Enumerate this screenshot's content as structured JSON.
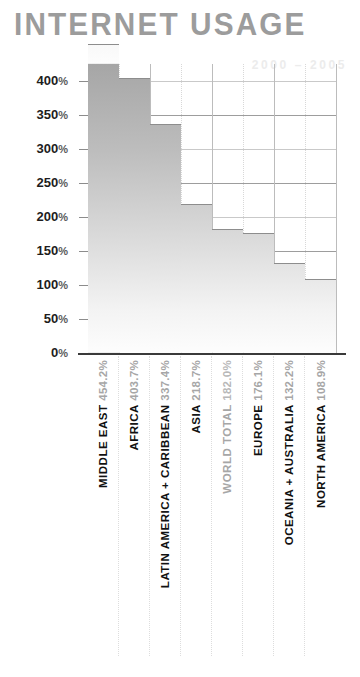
{
  "chart_data": {
    "type": "bar",
    "title": "INTERNET USAGE",
    "subtitle": "2000 – 2005",
    "xlabel": "",
    "ylabel": "",
    "ylim": [
      0,
      425
    ],
    "grid": true,
    "legend": "none",
    "orientation": "vertical",
    "yticks": [
      "0%",
      "50%",
      "100%",
      "150%",
      "200%",
      "250%",
      "300%",
      "350%",
      "400%"
    ],
    "ytick_values": [
      0,
      50,
      100,
      150,
      200,
      250,
      300,
      350,
      400
    ],
    "categories": [
      "MIDDLE EAST",
      "AFRICA",
      "LATIN AMERICA + CARIBBEAN",
      "ASIA",
      "WORLD TOTAL",
      "EUROPE",
      "OCEANIA + AUSTRALIA",
      "NORTH AMERICA"
    ],
    "values": [
      454.2,
      403.7,
      337.4,
      218.7,
      182.0,
      176.1,
      132.2,
      108.9
    ],
    "value_labels": [
      "454.2%",
      "403.7%",
      "337.4%",
      "218.7%",
      "182.0%",
      "176.1%",
      "132.2%",
      "108.9%"
    ],
    "bars": [
      {
        "name": "MIDDLE EAST",
        "value": 454.2,
        "value_label": "454.2%",
        "muted": false
      },
      {
        "name": "AFRICA",
        "value": 403.7,
        "value_label": "403.7%",
        "muted": false
      },
      {
        "name": "LATIN AMERICA + CARIBBEAN",
        "value": 337.4,
        "value_label": "337.4%",
        "muted": false
      },
      {
        "name": "ASIA",
        "value": 218.7,
        "value_label": "218.7%",
        "muted": false
      },
      {
        "name": "WORLD TOTAL",
        "value": 182.0,
        "value_label": "182.0%",
        "muted": true
      },
      {
        "name": "EUROPE",
        "value": 176.1,
        "value_label": "176.1%",
        "muted": false
      },
      {
        "name": "OCEANIA + AUSTRALIA",
        "value": 132.2,
        "value_label": "132.2%",
        "muted": false
      },
      {
        "name": "NORTH AMERICA",
        "value": 108.9,
        "value_label": "108.9%",
        "muted": false
      }
    ],
    "colors": {
      "title": "#9c9c9c",
      "subtitle": "#ececec",
      "bar_top": "#a6a6a6",
      "bar_bottom": "#fdfdfd",
      "gridline": "#9d9d9d",
      "baseline": "#3a3a3a",
      "label": "#111111",
      "value_label": "#a6a6a6"
    }
  }
}
